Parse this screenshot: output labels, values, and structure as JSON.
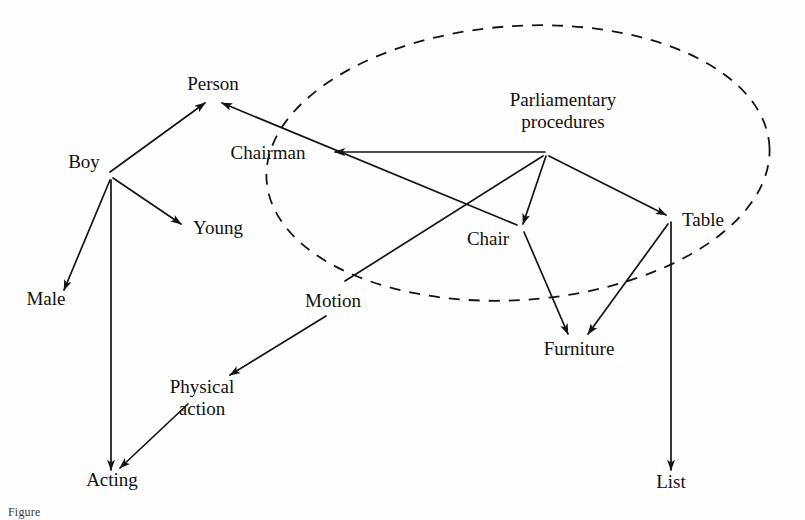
{
  "figure": {
    "type": "semantic-network",
    "caption": "Figure",
    "background_color": "#ffffff",
    "ink_color": "#141414"
  },
  "region": {
    "label": "parliamentary-procedures-context",
    "style": "dashed-ellipse",
    "cx": 518,
    "cy": 163,
    "rx": 252,
    "ry": 137,
    "rotation": -4
  },
  "nodes": [
    {
      "id": "person",
      "label": "Person",
      "x": 213,
      "y": 90,
      "anchor_x": 213,
      "anchor_y": 100,
      "lines": [
        "Person"
      ]
    },
    {
      "id": "boy",
      "label": "Boy",
      "x": 84,
      "y": 168,
      "anchor_x": 110,
      "anchor_y": 175,
      "lines": [
        "Boy"
      ]
    },
    {
      "id": "young",
      "label": "Young",
      "x": 218,
      "y": 234,
      "anchor_x": 182,
      "anchor_y": 227,
      "lines": [
        "Young"
      ]
    },
    {
      "id": "male",
      "label": "Male",
      "x": 46,
      "y": 305,
      "anchor_x": 62,
      "anchor_y": 293,
      "lines": [
        "Male"
      ]
    },
    {
      "id": "acting",
      "label": "Acting",
      "x": 112,
      "y": 486,
      "anchor_x": 112,
      "anchor_y": 472,
      "lines": [
        "Acting"
      ]
    },
    {
      "id": "chairman",
      "label": "Chairman",
      "x": 268,
      "y": 159,
      "anchor_x": 330,
      "anchor_y": 152,
      "lines": [
        "Chairman"
      ]
    },
    {
      "id": "parliamentary",
      "label": "Parliamentary procedures",
      "x": 563,
      "y": 106,
      "anchor_x": 545,
      "anchor_y": 153,
      "lines": [
        "Parliamentary",
        "procedures"
      ]
    },
    {
      "id": "chair",
      "label": "Chair",
      "x": 488,
      "y": 245,
      "anchor_x": 521,
      "anchor_y": 228,
      "lines": [
        "Chair"
      ]
    },
    {
      "id": "table",
      "label": "Table",
      "x": 703,
      "y": 226,
      "anchor_x": 670,
      "anchor_y": 218,
      "lines": [
        "Table"
      ]
    },
    {
      "id": "motion",
      "label": "Motion",
      "x": 333,
      "y": 307,
      "anchor_x": 345,
      "anchor_y": 282,
      "lines": [
        "Motion"
      ]
    },
    {
      "id": "physical_action",
      "label": "Physical action",
      "x": 202,
      "y": 393,
      "anchor_x": 202,
      "anchor_y": 381,
      "lines": [
        "Physical",
        "action"
      ]
    },
    {
      "id": "furniture",
      "label": "Furniture",
      "x": 579,
      "y": 355,
      "anchor_x": 576,
      "anchor_y": 337,
      "lines": [
        "Furniture"
      ]
    },
    {
      "id": "list",
      "label": "List",
      "x": 671,
      "y": 488,
      "anchor_x": 671,
      "anchor_y": 472,
      "lines": [
        "List"
      ]
    }
  ],
  "edges": [
    {
      "id": "boy-person",
      "from": "boy",
      "to": "person",
      "arrow": "end",
      "x1": 110,
      "y1": 172,
      "x2": 205,
      "y2": 103
    },
    {
      "id": "boy-young",
      "from": "boy",
      "to": "young",
      "arrow": "end",
      "x1": 113,
      "y1": 178,
      "x2": 181,
      "y2": 224
    },
    {
      "id": "boy-male",
      "from": "boy",
      "to": "male",
      "arrow": "end",
      "x1": 110,
      "y1": 180,
      "x2": 64,
      "y2": 290
    },
    {
      "id": "boy-acting",
      "from": "boy",
      "to": "acting",
      "arrow": "end",
      "x1": 111,
      "y1": 180,
      "x2": 111,
      "y2": 470
    },
    {
      "id": "chair-person",
      "from": "chair",
      "to": "person",
      "arrow": "end",
      "x1": 517,
      "y1": 225,
      "x2": 222,
      "y2": 103
    },
    {
      "id": "parl-chairman",
      "from": "parliamentary",
      "to": "chairman",
      "arrow": "end",
      "x1": 545,
      "y1": 152,
      "x2": 335,
      "y2": 152
    },
    {
      "id": "parl-chair",
      "from": "parliamentary",
      "to": "chair",
      "arrow": "end",
      "x1": 546,
      "y1": 156,
      "x2": 523,
      "y2": 224
    },
    {
      "id": "parl-table",
      "from": "parliamentary",
      "to": "table",
      "arrow": "end",
      "x1": 549,
      "y1": 156,
      "x2": 666,
      "y2": 215
    },
    {
      "id": "motion-parl",
      "from": "motion",
      "to": "parliamentary",
      "arrow": "none",
      "x1": 345,
      "y1": 281,
      "x2": 543,
      "y2": 156
    },
    {
      "id": "chair-furniture",
      "from": "chair",
      "to": "furniture",
      "arrow": "end",
      "x1": 524,
      "y1": 232,
      "x2": 568,
      "y2": 334
    },
    {
      "id": "table-furniture",
      "from": "table",
      "to": "furniture",
      "arrow": "end",
      "x1": 668,
      "y1": 224,
      "x2": 588,
      "y2": 334
    },
    {
      "id": "table-list",
      "from": "table",
      "to": "list",
      "arrow": "end",
      "x1": 671,
      "y1": 222,
      "x2": 671,
      "y2": 470
    },
    {
      "id": "motion-physical",
      "from": "motion",
      "to": "physical_action",
      "arrow": "end",
      "x1": 326,
      "y1": 316,
      "x2": 230,
      "y2": 375
    },
    {
      "id": "physical-acting",
      "from": "physical_action",
      "to": "acting",
      "arrow": "end",
      "x1": 188,
      "y1": 404,
      "x2": 120,
      "y2": 468
    }
  ]
}
